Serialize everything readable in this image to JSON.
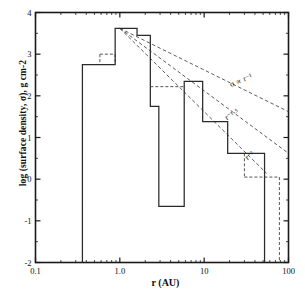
{
  "figure": {
    "ylabel": "log (surface density, σ), g cm-2",
    "xlabel": "r (AU)",
    "caption_fragment": ""
  },
  "chart_data": {
    "type": "line",
    "title": "",
    "xlabel": "r (AU)",
    "ylabel": "log (surface density, σ), g cm-2",
    "xscale": "log",
    "yscale": "linear",
    "xlim": [
      0.1,
      100
    ],
    "ylim": [
      -2,
      4
    ],
    "xticks": [
      0.1,
      1.0,
      10,
      100
    ],
    "xticklabels": [
      "0.1",
      "1.0",
      "10",
      "100"
    ],
    "yticks": [
      -2,
      -1,
      0,
      1,
      2,
      3,
      4
    ],
    "yticklabels": [
      "-2",
      "-1",
      "0",
      "1",
      "2",
      "3",
      "4"
    ],
    "grid": false,
    "legend": false,
    "series": [
      {
        "name": "solar-system-step-histogram",
        "style": "solid",
        "color": "#2a2a2a",
        "steps": [
          {
            "r_start": 0.36,
            "r_end": 0.5,
            "value": 2.75
          },
          {
            "r_start": 0.5,
            "r_end": 0.88,
            "value": 2.75
          },
          {
            "r_start": 0.88,
            "r_end": 1.08,
            "value": 3.62
          },
          {
            "r_start": 1.08,
            "r_end": 1.6,
            "value": 3.62
          },
          {
            "r_start": 1.6,
            "r_end": 2.3,
            "value": 3.45
          },
          {
            "r_start": 2.3,
            "r_end": 2.9,
            "value": 1.75
          },
          {
            "r_start": 2.9,
            "r_end": 5.8,
            "value": -0.65
          },
          {
            "r_start": 5.8,
            "r_end": 9.6,
            "value": 2.35
          },
          {
            "r_start": 9.6,
            "r_end": 19.0,
            "value": 1.38
          },
          {
            "r_start": 19.0,
            "r_end": 30.0,
            "value": 0.62
          },
          {
            "r_start": 30.0,
            "r_end": 52.0,
            "value": 0.62
          },
          {
            "r_start": 52.0,
            "r_end": 52.0,
            "value": -2.0
          }
        ]
      },
      {
        "name": "dashed-augmented-steps",
        "style": "dashed",
        "color": "#555555",
        "steps": [
          {
            "r_start": 0.58,
            "r_end": 0.88,
            "value": 3.0
          },
          {
            "r_start": 2.3,
            "r_end": 6.0,
            "value": 2.22
          },
          {
            "r_start": 30.0,
            "r_end": 78.0,
            "value": 0.05
          }
        ]
      }
    ],
    "powerlaw_lines": [
      {
        "label": "σ ∝ r⁻¹",
        "slope": -1.0,
        "r_start": 1.0,
        "r_end": 100,
        "y_at_r1": 3.62,
        "label_r": 28,
        "label_y": 2.32
      },
      {
        "label": "r⁻¹·⁵",
        "slope": -1.5,
        "r_start": 1.0,
        "r_end": 100,
        "y_at_r1": 3.62,
        "label_r": 22,
        "label_y": 1.5
      },
      {
        "label": "r⁻²",
        "slope": -2.0,
        "r_start": 1.0,
        "r_end": 55,
        "y_at_r1": 3.62,
        "label_r": 36,
        "label_y": 0.52
      }
    ],
    "annotations": [
      {
        "text": "σ ∝ r⁻¹",
        "r": 28,
        "y": 2.32,
        "rotation": -22
      },
      {
        "text": "r⁻¹·⁵",
        "r": 22,
        "y": 1.5,
        "rotation": -30
      },
      {
        "text": "r⁻²",
        "r": 36,
        "y": 0.52,
        "rotation": -38
      }
    ]
  }
}
